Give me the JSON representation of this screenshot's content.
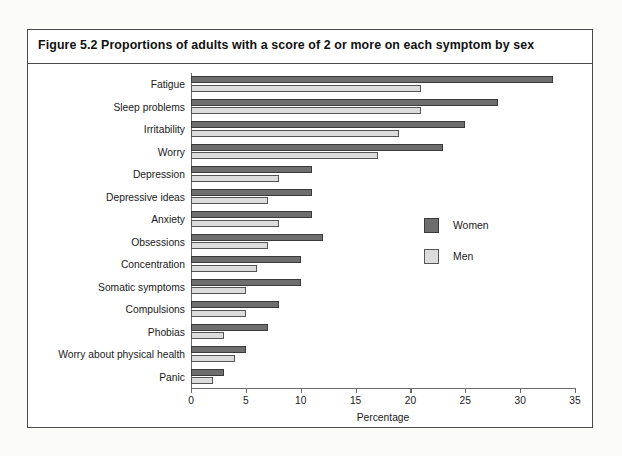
{
  "figure": {
    "title": "Figure 5.2  Proportions of adults with a score of 2 or more on each symptom by sex"
  },
  "legend": {
    "women_label": "Women",
    "men_label": "Men",
    "women_color": "#6e6e6e",
    "men_color": "#dcdcdc"
  },
  "axis": {
    "xlabel": "Percentage",
    "ticks": [
      "0",
      "5",
      "10",
      "15",
      "20",
      "25",
      "30",
      "35"
    ]
  },
  "chart_data": {
    "type": "bar",
    "orientation": "horizontal",
    "title": "Figure 5.2  Proportions of adults with a score of 2 or more on each symptom by sex",
    "xlabel": "Percentage",
    "ylabel": "",
    "xlim": [
      0,
      35
    ],
    "xticks": [
      0,
      5,
      10,
      15,
      20,
      25,
      30,
      35
    ],
    "grid": false,
    "legend_position": "right",
    "categories": [
      "Fatigue",
      "Sleep problems",
      "Irritability",
      "Worry",
      "Depression",
      "Depressive ideas",
      "Anxiety",
      "Obsessions",
      "Concentration",
      "Somatic symptoms",
      "Compulsions",
      "Phobias",
      "Worry about physical health",
      "Panic"
    ],
    "series": [
      {
        "name": "Women",
        "color": "#6e6e6e",
        "values": [
          33,
          28,
          25,
          23,
          11,
          11,
          11,
          12,
          10,
          10,
          8,
          7,
          5,
          3
        ]
      },
      {
        "name": "Men",
        "color": "#dcdcdc",
        "values": [
          21,
          21,
          19,
          17,
          8,
          7,
          8,
          7,
          6,
          5,
          5,
          3,
          4,
          2
        ]
      }
    ]
  }
}
